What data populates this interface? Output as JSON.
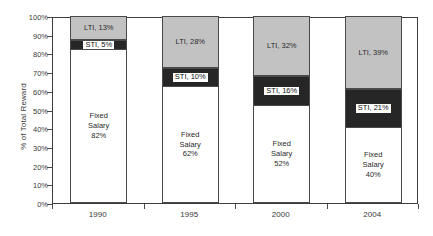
{
  "chart_data": {
    "type": "bar",
    "subtype": "stacked-bar-100-percent",
    "title": "",
    "subtitle": "",
    "xlabel": "",
    "ylabel": "% of Total Reward",
    "ylim": [
      0,
      100
    ],
    "y_tick_labels": [
      "0%",
      "10%",
      "20%",
      "30%",
      "40%",
      "50%",
      "60%",
      "70%",
      "80%",
      "90%",
      "100%"
    ],
    "y_tick_values": [
      0,
      10,
      20,
      30,
      40,
      50,
      60,
      70,
      80,
      90,
      100
    ],
    "grid": false,
    "legend": "none",
    "legend_position": "none",
    "categories": [
      "1990",
      "1995",
      "2000",
      "2004"
    ],
    "series": [
      {
        "name": "Fixed Salary",
        "color": "#ffffff",
        "values": [
          82,
          62,
          52,
          40
        ]
      },
      {
        "name": "STI",
        "color": "#262626",
        "values": [
          5,
          10,
          16,
          21
        ]
      },
      {
        "name": "LTI",
        "color": "#c2c2c2",
        "values": [
          13,
          28,
          32,
          39
        ]
      }
    ],
    "bars": [
      {
        "category": "1990",
        "fixed": {
          "label": "Fixed\nSalary\n82%",
          "value": 82,
          "base": 0
        },
        "sti": {
          "label": "STI, 5%",
          "value": 5,
          "base": 82
        },
        "lti": {
          "label": "LTI, 13%",
          "value": 13,
          "base": 87
        }
      },
      {
        "category": "1995",
        "fixed": {
          "label": "Fixed\nSalary\n62%",
          "value": 62,
          "base": 0
        },
        "sti": {
          "label": "STI, 10%",
          "value": 10,
          "base": 62
        },
        "lti": {
          "label": "LTI, 28%",
          "value": 28,
          "base": 72
        }
      },
      {
        "category": "2000",
        "fixed": {
          "label": "Fixed\nSalary\n52%",
          "value": 52,
          "base": 0
        },
        "sti": {
          "label": "STI, 16%",
          "value": 16,
          "base": 52
        },
        "lti": {
          "label": "LTI, 32%",
          "value": 32,
          "base": 68
        }
      },
      {
        "category": "2004",
        "fixed": {
          "label": "Fixed\nSalary\n40%",
          "value": 40,
          "base": 0
        },
        "sti": {
          "label": "STI, 21%",
          "value": 21,
          "base": 40
        },
        "lti": {
          "label": "LTI, 39%",
          "value": 39,
          "base": 61
        }
      }
    ],
    "colors": {
      "fixed_salary": "#ffffff",
      "sti": "#262626",
      "lti": "#c2c2c2",
      "axis": "#3d3d3d",
      "text": "#3a3a3a",
      "background": "#ffffff"
    }
  }
}
